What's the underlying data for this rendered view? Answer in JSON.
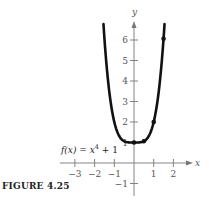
{
  "caption": "FIGURE 4.25",
  "chart_data": {
    "type": "line",
    "title": "",
    "function_label": "f(x) = x⁴ + 1",
    "function_label_parts": {
      "prefix": "f(x) = x",
      "exponent": "4",
      "suffix": " + 1"
    },
    "xlabel": "x",
    "ylabel": "y",
    "xlim": [
      -3.5,
      2.8
    ],
    "ylim": [
      -1.6,
      7.0
    ],
    "grid": false,
    "x_ticks": [
      -3,
      -2,
      -1,
      1,
      2
    ],
    "x_tick_labels": [
      "−3",
      "−2",
      "−1",
      "1",
      "2"
    ],
    "y_ticks": [
      -1,
      1,
      2,
      3,
      4,
      5,
      6
    ],
    "y_tick_labels": [
      "−1",
      "1",
      "2",
      "3",
      "4",
      "5",
      "6"
    ],
    "series": [
      {
        "name": "f(x) = x^4 + 1",
        "expression": "x^4 + 1",
        "x_range": [
          -1.55,
          1.55
        ],
        "sample_points": {
          "x": [
            -1.5,
            -1,
            -0.5,
            0,
            0.5,
            1,
            1.5
          ],
          "y": [
            6.0625,
            2,
            1.0625,
            1,
            1.0625,
            2,
            6.0625
          ]
        }
      }
    ],
    "marked_points": [
      {
        "x": 0,
        "y": 1
      },
      {
        "x": 0.5,
        "y": 1.0625
      },
      {
        "x": 1,
        "y": 2
      },
      {
        "x": 1.5,
        "y": 6.0625
      }
    ]
  }
}
